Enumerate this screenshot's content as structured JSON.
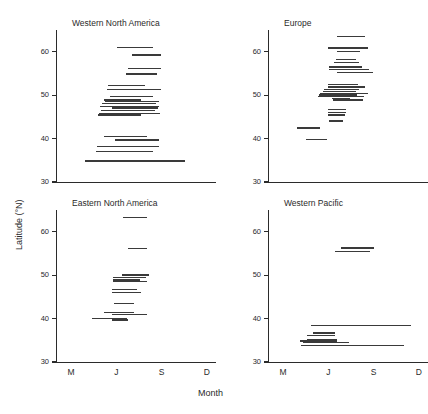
{
  "figure": {
    "xlabel": "Month",
    "ylabel": "Latitude (°N)"
  },
  "chart_data": {
    "type": "line",
    "title": "",
    "xlabel": "Month",
    "ylabel": "Latitude (°N)",
    "grid": false,
    "legend": "none",
    "xlim": [
      2.0,
      12.6
    ],
    "ylim": [
      30,
      65
    ],
    "yticks": [
      30,
      40,
      50,
      60
    ],
    "xticks": [
      3,
      6,
      9,
      12
    ],
    "xticklabels": [
      "M",
      "J",
      "S",
      "D"
    ],
    "note": "Each panel plots horizontal segments; x extent = month span of occurrence, y = latitude of record.",
    "panels": [
      {
        "title": "Western North America",
        "show_xticklabels": false,
        "segments": [
          {
            "lat": 61.2,
            "x0": 6.05,
            "x1": 8.45
          },
          {
            "lat": 59.4,
            "x0": 7.05,
            "x1": 8.95
          },
          {
            "lat": 56.2,
            "x0": 6.75,
            "x1": 8.95
          },
          {
            "lat": 55.0,
            "x0": 6.65,
            "x1": 8.7
          },
          {
            "lat": 52.4,
            "x0": 5.45,
            "x1": 7.9
          },
          {
            "lat": 51.5,
            "x0": 5.4,
            "x1": 8.95
          },
          {
            "lat": 49.8,
            "x0": 5.55,
            "x1": 8.45
          },
          {
            "lat": 49.0,
            "x0": 5.2,
            "x1": 7.6
          },
          {
            "lat": 48.6,
            "x0": 5.25,
            "x1": 8.8
          },
          {
            "lat": 48.2,
            "x0": 5.05,
            "x1": 8.65
          },
          {
            "lat": 47.6,
            "x0": 4.9,
            "x1": 8.85
          },
          {
            "lat": 47.2,
            "x0": 5.7,
            "x1": 8.75
          },
          {
            "lat": 46.6,
            "x0": 5.0,
            "x1": 8.55
          },
          {
            "lat": 45.9,
            "x0": 4.85,
            "x1": 8.9
          },
          {
            "lat": 45.6,
            "x0": 4.8,
            "x1": 7.6
          },
          {
            "lat": 40.6,
            "x0": 5.15,
            "x1": 8.0
          },
          {
            "lat": 39.8,
            "x0": 5.9,
            "x1": 8.85
          },
          {
            "lat": 38.4,
            "x0": 4.7,
            "x1": 8.8
          },
          {
            "lat": 37.2,
            "x0": 4.65,
            "x1": 8.45
          },
          {
            "lat": 35.0,
            "x0": 3.95,
            "x1": 10.55
          }
        ]
      },
      {
        "title": "Europe",
        "show_xticklabels": false,
        "segments": [
          {
            "lat": 63.6,
            "x0": 6.55,
            "x1": 8.45
          },
          {
            "lat": 61.0,
            "x0": 5.95,
            "x1": 8.6
          },
          {
            "lat": 60.2,
            "x0": 6.55,
            "x1": 8.1
          },
          {
            "lat": 58.4,
            "x0": 6.5,
            "x1": 7.85
          },
          {
            "lat": 57.6,
            "x0": 6.4,
            "x1": 8.05
          },
          {
            "lat": 56.6,
            "x0": 6.05,
            "x1": 8.2
          },
          {
            "lat": 56.0,
            "x0": 6.05,
            "x1": 8.7
          },
          {
            "lat": 55.4,
            "x0": 6.55,
            "x1": 8.95
          },
          {
            "lat": 52.6,
            "x0": 6.0,
            "x1": 7.95
          },
          {
            "lat": 52.0,
            "x0": 5.95,
            "x1": 8.4
          },
          {
            "lat": 51.4,
            "x0": 5.7,
            "x1": 8.05
          },
          {
            "lat": 51.0,
            "x0": 5.65,
            "x1": 7.85
          },
          {
            "lat": 50.6,
            "x0": 5.45,
            "x1": 8.6
          },
          {
            "lat": 50.2,
            "x0": 5.4,
            "x1": 7.9
          },
          {
            "lat": 49.8,
            "x0": 5.3,
            "x1": 8.35
          },
          {
            "lat": 49.4,
            "x0": 6.25,
            "x1": 7.45
          },
          {
            "lat": 49.0,
            "x0": 6.3,
            "x1": 8.3
          },
          {
            "lat": 46.8,
            "x0": 5.95,
            "x1": 7.15
          },
          {
            "lat": 46.2,
            "x0": 5.95,
            "x1": 7.15
          },
          {
            "lat": 45.6,
            "x0": 5.95,
            "x1": 7.1
          },
          {
            "lat": 44.2,
            "x0": 6.05,
            "x1": 6.95
          },
          {
            "lat": 42.6,
            "x0": 3.95,
            "x1": 5.45
          },
          {
            "lat": 40.0,
            "x0": 4.55,
            "x1": 5.9
          }
        ]
      },
      {
        "title": "Eastern North America",
        "show_xticklabels": true,
        "segments": [
          {
            "lat": 63.4,
            "x0": 6.45,
            "x1": 8.05
          },
          {
            "lat": 56.2,
            "x0": 6.8,
            "x1": 8.05
          },
          {
            "lat": 50.2,
            "x0": 6.35,
            "x1": 8.15
          },
          {
            "lat": 49.6,
            "x0": 5.8,
            "x1": 7.95
          },
          {
            "lat": 49.0,
            "x0": 5.75,
            "x1": 7.55
          },
          {
            "lat": 48.6,
            "x0": 5.8,
            "x1": 8.0
          },
          {
            "lat": 46.8,
            "x0": 5.7,
            "x1": 7.35
          },
          {
            "lat": 46.2,
            "x0": 5.7,
            "x1": 7.65
          },
          {
            "lat": 43.6,
            "x0": 5.85,
            "x1": 7.15
          },
          {
            "lat": 41.6,
            "x0": 5.15,
            "x1": 7.2
          },
          {
            "lat": 41.0,
            "x0": 5.7,
            "x1": 8.05
          },
          {
            "lat": 40.2,
            "x0": 4.4,
            "x1": 6.7
          },
          {
            "lat": 39.8,
            "x0": 5.7,
            "x1": 6.75
          }
        ]
      },
      {
        "title": "Western Pacific",
        "show_xticklabels": true,
        "segments": [
          {
            "lat": 56.4,
            "x0": 6.85,
            "x1": 9.0
          },
          {
            "lat": 55.6,
            "x0": 6.45,
            "x1": 8.75
          },
          {
            "lat": 38.6,
            "x0": 4.85,
            "x1": 11.5
          },
          {
            "lat": 36.8,
            "x0": 4.95,
            "x1": 6.45
          },
          {
            "lat": 36.2,
            "x0": 4.6,
            "x1": 6.45
          },
          {
            "lat": 35.4,
            "x0": 4.6,
            "x1": 6.6
          },
          {
            "lat": 35.0,
            "x0": 4.15,
            "x1": 6.55
          },
          {
            "lat": 34.6,
            "x0": 4.35,
            "x1": 7.35
          },
          {
            "lat": 34.0,
            "x0": 4.2,
            "x1": 11.0
          }
        ]
      }
    ]
  }
}
